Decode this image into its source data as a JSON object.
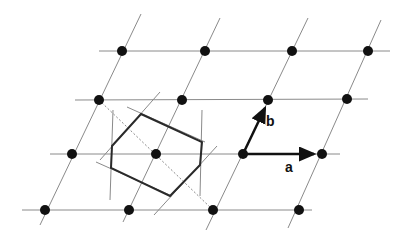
{
  "diagram": {
    "colors": {
      "lattice_line": "#8a8a8a",
      "point": "#111111",
      "cell": "#2a2a2a",
      "vector": "#111111"
    },
    "vectors": [
      {
        "name": "a",
        "label": "a"
      },
      {
        "name": "b",
        "label": "b"
      }
    ],
    "rows": [
      {
        "y": 51,
        "points": [
          122,
          205,
          292,
          368
        ]
      },
      {
        "y": 100,
        "points": [
          99,
          182,
          268,
          347
        ]
      },
      {
        "y": 154,
        "points": [
          72,
          156,
          243,
          322
        ]
      },
      {
        "y": 210,
        "points": [
          45,
          129,
          213,
          299
        ]
      }
    ]
  }
}
